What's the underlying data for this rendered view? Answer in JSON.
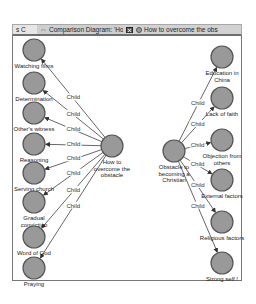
{
  "tabs": [
    {
      "label": "s C"
    },
    {
      "label": "Comparison Diagram: 'Ho"
    },
    {
      "label": "How to overcome the obs"
    }
  ],
  "diagram": {
    "node_fill": "#999999",
    "node_stroke": "#555555",
    "edge_color": "#555555",
    "edge_label": "Child",
    "left_center": {
      "label_lines": [
        "How to",
        "overcome the",
        "obstacle"
      ],
      "x": 112,
      "y": 146
    },
    "right_center": {
      "label_lines": [
        "Obstacle to",
        "becoming a",
        "Christian"
      ],
      "x": 174,
      "y": 151
    },
    "left_children": [
      {
        "label_lines": [
          "Watching films"
        ],
        "x": 34,
        "y": 50
      },
      {
        "label_lines": [
          "Determination"
        ],
        "x": 34,
        "y": 83
      },
      {
        "label_lines": [
          "Other's witness"
        ],
        "x": 34,
        "y": 113
      },
      {
        "label_lines": [
          "Reasoning"
        ],
        "x": 34,
        "y": 144
      },
      {
        "label_lines": [
          "Serving church"
        ],
        "x": 34,
        "y": 173
      },
      {
        "label_lines": [
          "Gradual",
          "conviction"
        ],
        "x": 34,
        "y": 202
      },
      {
        "label_lines": [
          "Word of God"
        ],
        "x": 34,
        "y": 237
      },
      {
        "label_lines": [
          "Praying"
        ],
        "x": 34,
        "y": 268
      }
    ],
    "right_children": [
      {
        "label_lines": [
          "Education in",
          "China"
        ],
        "x": 222,
        "y": 57
      },
      {
        "label_lines": [
          "Lack of faith"
        ],
        "x": 222,
        "y": 98
      },
      {
        "label_lines": [
          "Objection from",
          "others"
        ],
        "x": 222,
        "y": 140
      },
      {
        "label_lines": [
          "External factors"
        ],
        "x": 222,
        "y": 180
      },
      {
        "label_lines": [
          "Religious factors"
        ],
        "x": 222,
        "y": 222
      },
      {
        "label_lines": [
          "Strong self !"
        ],
        "x": 222,
        "y": 263
      }
    ]
  }
}
